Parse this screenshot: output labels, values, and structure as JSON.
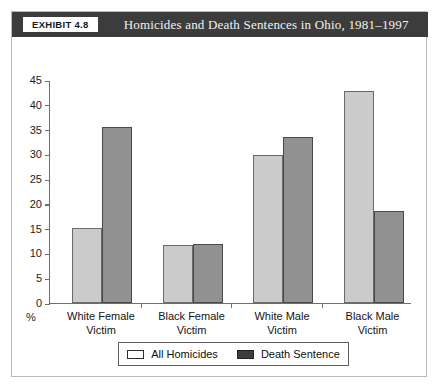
{
  "exhibit": {
    "tag": "EXHIBIT 4.8",
    "title": "Homicides and Death Sentences in Ohio, 1981–1997"
  },
  "chart_data": {
    "type": "bar",
    "title": "Homicides and Death Sentences in Ohio, 1981–1997",
    "xlabel": "",
    "ylabel": "%",
    "ylim": [
      0,
      45
    ],
    "yticks": [
      0,
      5,
      10,
      15,
      20,
      25,
      30,
      35,
      40,
      45
    ],
    "grid": false,
    "legend_position": "bottom",
    "categories": [
      "White Female Victim",
      "Black Female Victim",
      "White Male Victim",
      "Black Male Victim"
    ],
    "category_lines": [
      [
        "White Female",
        "Victim"
      ],
      [
        "Black Female",
        "Victim"
      ],
      [
        "White Male",
        "Victim"
      ],
      [
        "Black Male",
        "Victim"
      ]
    ],
    "series": [
      {
        "name": "All Homicides",
        "color": "#cbcbcb",
        "values": [
          15.2,
          11.7,
          29.8,
          42.8
        ]
      },
      {
        "name": "Death Sentence",
        "color": "#919191",
        "values": [
          35.5,
          12.0,
          33.5,
          18.5
        ]
      }
    ]
  },
  "legend": {
    "items": [
      {
        "label": "All Homicides",
        "swatch": "light"
      },
      {
        "label": "Death Sentence",
        "swatch": "dark"
      }
    ]
  }
}
